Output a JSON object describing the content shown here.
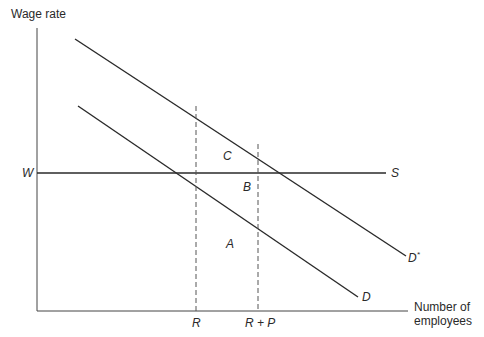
{
  "diagram": {
    "y_axis_label": "Wage rate",
    "x_axis_label_line1": "Number of",
    "x_axis_label_line2": "employees",
    "wage_label": "W",
    "supply_label": "S",
    "demand_label": "D",
    "demand_star_label": "D",
    "demand_star_sup": "*",
    "region_a": "A",
    "region_b": "B",
    "region_c": "C",
    "tick_r": "R",
    "tick_rp": "R + P",
    "line_color": "#2a2a2a"
  }
}
